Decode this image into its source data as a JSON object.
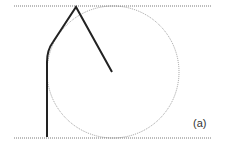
{
  "figure": {
    "label": "(a)",
    "colors": {
      "dotted": "#555555",
      "circle": "#777777",
      "path": "#222222"
    }
  }
}
